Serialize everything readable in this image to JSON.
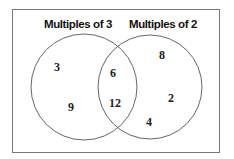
{
  "diagram": {
    "type": "venn",
    "sets": [
      {
        "label": "Multiples of 3",
        "only": [
          "3",
          "9"
        ]
      },
      {
        "label": "Multiples of 2",
        "only": [
          "8",
          "2",
          "4"
        ]
      }
    ],
    "intersection": [
      "6",
      "12"
    ]
  },
  "labels": {
    "left_set": "Multiples of 3",
    "right_set": "Multiples of 2"
  },
  "values": {
    "left_only_1": "3",
    "left_only_2": "9",
    "both_1": "6",
    "both_2": "12",
    "right_only_1": "8",
    "right_only_2": "2",
    "right_only_3": "4"
  }
}
